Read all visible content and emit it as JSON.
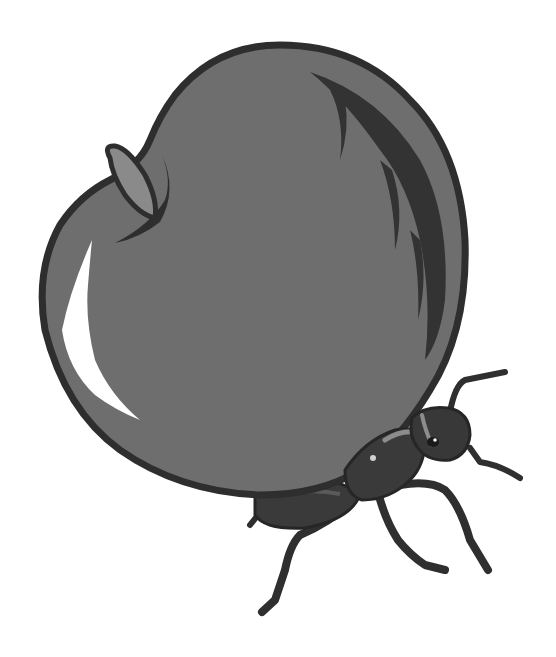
{
  "illustration": {
    "subject": "Ant carrying an apple",
    "style": "grayscale clipart",
    "colors": {
      "background": "#ffffff",
      "apple_fill": "#6e6e6e",
      "apple_outline": "#2e2e2e",
      "apple_shading": "#333333",
      "highlight": "#ffffff",
      "leaf_fill": "#8a8a8a",
      "ant_body": "#3a3a3a",
      "ant_dark": "#262626",
      "ant_highlight": "#8c8c8c"
    },
    "elements": [
      "apple",
      "apple-leaf",
      "apple-highlight",
      "apple-shading",
      "ant-head",
      "ant-eye",
      "ant-antennae",
      "ant-thorax",
      "ant-abdomen",
      "ant-legs"
    ]
  }
}
